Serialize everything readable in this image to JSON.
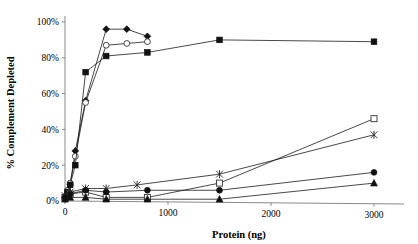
{
  "chart_data": {
    "type": "line",
    "title": "",
    "xlabel": "Protein (ng)",
    "ylabel": "% Complement Depleted",
    "xlim": [
      0,
      3300
    ],
    "ylim": [
      0,
      100
    ],
    "xticks": [
      0,
      1000,
      2000,
      3000
    ],
    "xticklabels": [
      "0",
      "1000",
      "2000",
      "3000"
    ],
    "yticks": [
      0,
      20,
      40,
      60,
      80,
      100
    ],
    "yticklabels": [
      "0%",
      "20%",
      "40%",
      "60%",
      "80%",
      "100%"
    ],
    "grid": false,
    "legend": "none",
    "series": [
      {
        "name": "Series 1",
        "marker": "filled-diamond",
        "x": [
          0,
          10,
          25,
          50,
          100,
          200,
          400,
          600,
          800
        ],
        "y": [
          2,
          3,
          5,
          9,
          28,
          56,
          96,
          96,
          92
        ]
      },
      {
        "name": "Series 2",
        "marker": "open-circle",
        "x": [
          0,
          10,
          25,
          50,
          100,
          200,
          400,
          600,
          800
        ],
        "y": [
          1,
          3,
          6,
          10,
          25,
          55,
          87,
          88,
          89
        ]
      },
      {
        "name": "Series 3",
        "marker": "filled-square",
        "x": [
          0,
          25,
          50,
          100,
          200,
          400,
          800,
          1500,
          3000
        ],
        "y": [
          2,
          5,
          9,
          20,
          72,
          81,
          83,
          90,
          89
        ]
      },
      {
        "name": "Series 4",
        "marker": "x-cross",
        "x": [
          0,
          50,
          200,
          400,
          700,
          1500,
          3000
        ],
        "y": [
          3,
          5,
          7,
          7,
          9,
          15,
          37
        ]
      },
      {
        "name": "Series 5",
        "marker": "open-square",
        "x": [
          0,
          50,
          200,
          400,
          800,
          1500,
          3000
        ],
        "y": [
          2,
          4,
          5,
          2,
          2,
          10,
          46
        ]
      },
      {
        "name": "Series 6",
        "marker": "filled-circle",
        "x": [
          0,
          50,
          200,
          400,
          800,
          1500,
          3000
        ],
        "y": [
          2,
          4,
          6,
          5,
          6,
          6,
          16
        ]
      },
      {
        "name": "Series 7",
        "marker": "filled-triangle",
        "x": [
          0,
          50,
          200,
          400,
          800,
          1500,
          3000
        ],
        "y": [
          1,
          2,
          2,
          1,
          1,
          1,
          10
        ]
      }
    ]
  }
}
